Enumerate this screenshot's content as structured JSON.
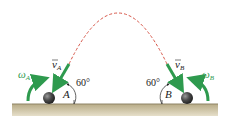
{
  "diagram": {
    "colors": {
      "vector_green": "#2e9a4e",
      "trajectory_dashed": "#d7574a",
      "ground_fill": "#c9bfa0",
      "ground_top": "#8f8466",
      "ball": "#3a3a3a"
    },
    "labels": {
      "omega_a": "ω",
      "omega_a_sub": "A",
      "v_a": "v",
      "v_a_sub": "A",
      "angle_a": "60°",
      "point_a": "A",
      "angle_b": "60°",
      "point_b": "B",
      "v_b": "v",
      "v_b_sub": "B",
      "omega_b": "ω",
      "omega_b_sub": "B"
    }
  }
}
